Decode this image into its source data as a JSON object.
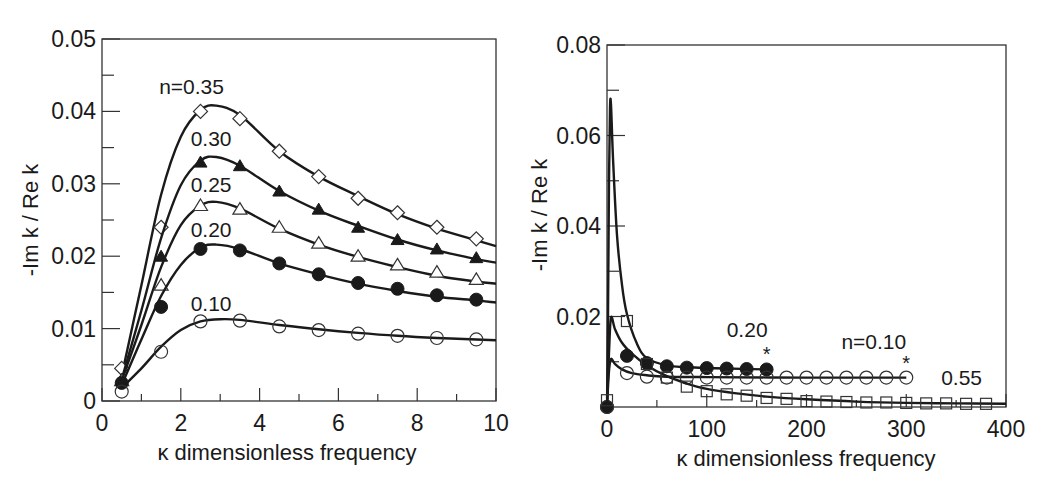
{
  "chart_data": [
    {
      "type": "line",
      "panel": "left",
      "title": "",
      "xlabel": "κ  dimensionless frequency",
      "ylabel": "-Im k / Re k",
      "xlim": [
        0,
        10
      ],
      "ylim": [
        0,
        0.05
      ],
      "x_ticks": [
        0,
        2,
        4,
        6,
        8,
        10
      ],
      "x_tick_labels": [
        "0",
        "2",
        "4",
        "6",
        "8",
        "10"
      ],
      "x_minor_ticks": [
        1,
        3,
        5,
        7,
        9
      ],
      "y_ticks": [
        0,
        0.01,
        0.02,
        0.03,
        0.04,
        0.05
      ],
      "y_tick_labels": [
        "0",
        "0.01",
        "0.02",
        "0.03",
        "0.04",
        "0.05"
      ],
      "y_minor_ticks": [
        0.005,
        0.015,
        0.025,
        0.035,
        0.045
      ],
      "grid": false,
      "legend": "inline labels on curves",
      "series": [
        {
          "name": "n=0.35",
          "label": "n=0.35",
          "marker": "diamond-open",
          "label_pos": [
            1.45,
            0.0424
          ],
          "x": [
            0.5,
            1.5,
            2.5,
            3.5,
            4.5,
            5.5,
            6.5,
            7.5,
            8.5,
            9.5
          ],
          "values": [
            0.0045,
            0.024,
            0.04,
            0.039,
            0.0345,
            0.031,
            0.028,
            0.026,
            0.024,
            0.0224
          ],
          "curve": [
            [
              0.5,
              0.0035
            ],
            [
              1.0,
              0.016
            ],
            [
              1.5,
              0.0285
            ],
            [
              2.0,
              0.0365
            ],
            [
              2.5,
              0.0402
            ],
            [
              2.9,
              0.0408
            ],
            [
              3.5,
              0.0395
            ],
            [
              4.5,
              0.0345
            ],
            [
              5.5,
              0.031
            ],
            [
              6.5,
              0.0283
            ],
            [
              7.5,
              0.0258
            ],
            [
              8.5,
              0.0238
            ],
            [
              9.5,
              0.0222
            ],
            [
              10.0,
              0.0214
            ]
          ]
        },
        {
          "name": "n=0.30",
          "label": "0.30",
          "marker": "triangle-filled",
          "label_pos": [
            2.25,
            0.0352
          ],
          "x": [
            0.5,
            1.5,
            2.5,
            3.5,
            4.5,
            5.5,
            6.5,
            7.5,
            8.5,
            9.5
          ],
          "values": [
            0.003,
            0.02,
            0.033,
            0.0325,
            0.029,
            0.0265,
            0.024,
            0.0223,
            0.021,
            0.0198
          ],
          "curve": [
            [
              0.5,
              0.003
            ],
            [
              1.0,
              0.0125
            ],
            [
              1.5,
              0.0225
            ],
            [
              2.0,
              0.0298
            ],
            [
              2.5,
              0.0332
            ],
            [
              2.9,
              0.0337
            ],
            [
              3.5,
              0.0325
            ],
            [
              4.5,
              0.029
            ],
            [
              5.5,
              0.0263
            ],
            [
              6.5,
              0.0242
            ],
            [
              7.5,
              0.0223
            ],
            [
              8.5,
              0.0208
            ],
            [
              9.5,
              0.0196
            ],
            [
              10.0,
              0.0191
            ]
          ]
        },
        {
          "name": "n=0.25",
          "label": "0.25",
          "marker": "triangle-open",
          "label_pos": [
            2.25,
            0.0288
          ],
          "x": [
            0.5,
            1.5,
            2.5,
            3.5,
            4.5,
            5.5,
            6.5,
            7.5,
            8.5,
            9.5
          ],
          "values": [
            0.0028,
            0.016,
            0.027,
            0.0265,
            0.024,
            0.0218,
            0.02,
            0.0188,
            0.0178,
            0.0168
          ],
          "curve": [
            [
              0.5,
              0.0028
            ],
            [
              1.0,
              0.0105
            ],
            [
              1.5,
              0.0185
            ],
            [
              2.0,
              0.0243
            ],
            [
              2.5,
              0.027
            ],
            [
              2.9,
              0.0275
            ],
            [
              3.5,
              0.0266
            ],
            [
              4.5,
              0.0238
            ],
            [
              5.5,
              0.0216
            ],
            [
              6.5,
              0.0199
            ],
            [
              7.5,
              0.0185
            ],
            [
              8.5,
              0.0173
            ],
            [
              9.5,
              0.0165
            ],
            [
              10.0,
              0.0162
            ]
          ]
        },
        {
          "name": "n=0.20",
          "label": "0.20",
          "marker": "circle-filled",
          "label_pos": [
            2.25,
            0.0226
          ],
          "x": [
            0.5,
            1.5,
            2.5,
            3.5,
            4.5,
            5.5,
            6.5,
            7.5,
            8.5,
            9.5
          ],
          "values": [
            0.0025,
            0.013,
            0.021,
            0.0208,
            0.019,
            0.0175,
            0.0163,
            0.0155,
            0.0146,
            0.014
          ],
          "curve": [
            [
              0.5,
              0.0022
            ],
            [
              1.0,
              0.0085
            ],
            [
              1.5,
              0.0145
            ],
            [
              2.0,
              0.0188
            ],
            [
              2.5,
              0.0212
            ],
            [
              2.9,
              0.0216
            ],
            [
              3.5,
              0.021
            ],
            [
              4.5,
              0.019
            ],
            [
              5.5,
              0.0175
            ],
            [
              6.5,
              0.0162
            ],
            [
              7.5,
              0.0152
            ],
            [
              8.5,
              0.0144
            ],
            [
              9.5,
              0.0139
            ],
            [
              10.0,
              0.0136
            ]
          ]
        },
        {
          "name": "n=0.10",
          "label": "0.10",
          "marker": "circle-open",
          "label_pos": [
            2.25,
            0.0125
          ],
          "x": [
            0.5,
            1.5,
            2.5,
            3.5,
            4.5,
            5.5,
            6.5,
            7.5,
            8.5,
            9.5
          ],
          "values": [
            0.0013,
            0.0068,
            0.011,
            0.0111,
            0.0103,
            0.0098,
            0.0093,
            0.009,
            0.0087,
            0.0085
          ],
          "curve": [
            [
              0.5,
              0.0018
            ],
            [
              1.0,
              0.0045
            ],
            [
              1.5,
              0.0075
            ],
            [
              2.0,
              0.0098
            ],
            [
              2.5,
              0.011
            ],
            [
              3.0,
              0.0113
            ],
            [
              3.5,
              0.0112
            ],
            [
              4.5,
              0.0105
            ],
            [
              5.5,
              0.0099
            ],
            [
              6.5,
              0.0094
            ],
            [
              7.5,
              0.009
            ],
            [
              8.5,
              0.0087
            ],
            [
              9.5,
              0.0085
            ],
            [
              10.0,
              0.0084
            ]
          ]
        }
      ]
    },
    {
      "type": "line",
      "panel": "right",
      "title": "",
      "xlabel": "κ  dimensionless frequency",
      "ylabel": "-Im k / Re k",
      "xlim": [
        0,
        400
      ],
      "ylim": [
        0,
        0.08
      ],
      "x_ticks": [
        0,
        100,
        200,
        300,
        400
      ],
      "x_tick_labels": [
        "0",
        "100",
        "200",
        "300",
        "400"
      ],
      "x_minor_ticks": [
        50,
        150,
        250,
        350
      ],
      "y_ticks": [
        0.02,
        0.04,
        0.06,
        0.08
      ],
      "y_tick_labels": [
        "0.02",
        "0.04",
        "0.06",
        "0.08"
      ],
      "y_minor_ticks": [
        0.01,
        0.03,
        0.05,
        0.07
      ],
      "grid": false,
      "legend": "inline labels on curves",
      "series": [
        {
          "name": "n=0.20",
          "label": "0.20",
          "marker": "circle-filled",
          "label_pos": [
            120,
            0.0155
          ],
          "end_marker": "*",
          "x": [
            0,
            20,
            40,
            60,
            80,
            100,
            120,
            140,
            160
          ],
          "values": [
            0.0,
            0.0113,
            0.0097,
            0.009,
            0.0087,
            0.0086,
            0.0085,
            0.0084,
            0.0083
          ],
          "curve": [
            [
              0,
              0.0
            ],
            [
              1,
              0.02
            ],
            [
              2,
              0.05
            ],
            [
              3,
              0.066
            ],
            [
              4,
              0.0668
            ],
            [
              6,
              0.055
            ],
            [
              10,
              0.038
            ],
            [
              15,
              0.027
            ],
            [
              20,
              0.0205
            ],
            [
              30,
              0.014
            ],
            [
              40,
              0.0108
            ],
            [
              60,
              0.0092
            ],
            [
              80,
              0.0088
            ],
            [
              120,
              0.0085
            ],
            [
              160,
              0.0083
            ]
          ]
        },
        {
          "name": "n=0.10",
          "label": "n=0.10",
          "marker": "circle-open",
          "label_pos": [
            235,
            0.0128
          ],
          "end_marker": "*",
          "x": [
            0,
            20,
            40,
            60,
            80,
            100,
            120,
            140,
            160,
            180,
            200,
            220,
            240,
            260,
            280,
            300
          ],
          "values": [
            0.0,
            0.0075,
            0.0067,
            0.0065,
            0.0065,
            0.0065,
            0.0065,
            0.0065,
            0.0065,
            0.0065,
            0.0065,
            0.0065,
            0.0065,
            0.0065,
            0.0065,
            0.0065
          ],
          "curve": [
            [
              0,
              0.0
            ],
            [
              2,
              0.008
            ],
            [
              4,
              0.0106
            ],
            [
              8,
              0.0095
            ],
            [
              15,
              0.0083
            ],
            [
              25,
              0.0075
            ],
            [
              40,
              0.007
            ],
            [
              60,
              0.0067
            ],
            [
              100,
              0.0066
            ],
            [
              200,
              0.0065
            ],
            [
              300,
              0.0065
            ]
          ]
        },
        {
          "name": "n=0.55",
          "label": "0.55",
          "marker": "square-open",
          "label_pos": [
            335,
            0.0048
          ],
          "x": [
            0,
            20,
            40,
            60,
            80,
            100,
            120,
            140,
            160,
            180,
            200,
            220,
            240,
            260,
            280,
            300,
            320,
            340,
            360,
            380
          ],
          "values": [
            0.0015,
            0.019,
            0.0095,
            0.0065,
            0.0045,
            0.0035,
            0.0028,
            0.0025,
            0.002,
            0.0018,
            0.0013,
            0.0012,
            0.0011,
            0.001,
            0.001,
            0.0009,
            0.0008,
            0.0008,
            0.0007,
            0.0007
          ],
          "curve": [
            [
              0,
              0.0
            ],
            [
              2,
              0.012
            ],
            [
              4,
              0.0198
            ],
            [
              8,
              0.0172
            ],
            [
              15,
              0.0142
            ],
            [
              25,
              0.0118
            ],
            [
              40,
              0.0092
            ],
            [
              60,
              0.0068
            ],
            [
              80,
              0.0052
            ],
            [
              100,
              0.004
            ],
            [
              130,
              0.003
            ],
            [
              160,
              0.0023
            ],
            [
              200,
              0.0017
            ],
            [
              250,
              0.0012
            ],
            [
              300,
              0.0009
            ],
            [
              350,
              0.0008
            ],
            [
              400,
              0.0007
            ]
          ]
        }
      ]
    }
  ],
  "panels": {
    "left": {
      "xlabel": "κ  dimensionless frequency",
      "ylabel": "-Im k / Re k"
    },
    "right": {
      "xlabel": "κ  dimensionless frequency",
      "ylabel": "-Im k / Re k"
    }
  },
  "colors": {
    "line": "#1a1a1a",
    "axis": "#333333",
    "background": "#ffffff",
    "marker_stroke": "#333333"
  }
}
